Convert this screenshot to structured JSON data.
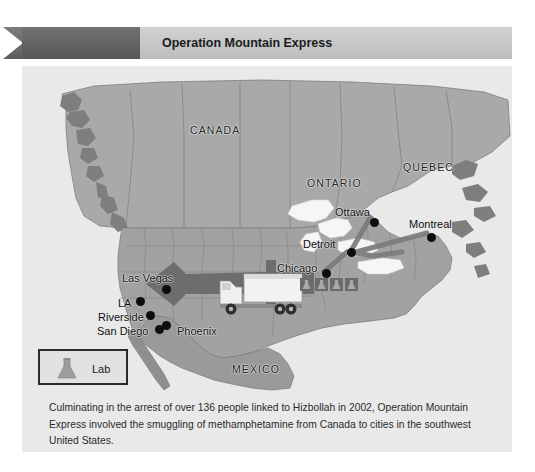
{
  "figure": {
    "number": "Figure 20-1",
    "title": "Operation Mountain Express",
    "caption": "Culminating in the arrest of over 136 people linked to Hizbollah in 2002, Operation Mountain Express involved the smuggling of methamphetamine from Canada to cities in the southwest United States."
  },
  "legend": {
    "label": "Lab",
    "icon": "flask-icon"
  },
  "map": {
    "regions": [
      {
        "name": "CANADA",
        "x": 168,
        "y": 58
      },
      {
        "name": "ONTARIO",
        "x": 285,
        "y": 111
      },
      {
        "name": "QUEBEC",
        "x": 381,
        "y": 95
      },
      {
        "name": "MEXICO",
        "x": 210,
        "y": 297
      }
    ],
    "cities": [
      {
        "name": "Ottawa",
        "label_x": 313,
        "label_y": 140,
        "dot_x": 348,
        "dot_y": 152,
        "align": "right"
      },
      {
        "name": "Montreal",
        "label_x": 387,
        "label_y": 152,
        "dot_x": 405,
        "dot_y": 167,
        "align": "left"
      },
      {
        "name": "Detroit",
        "label_x": 281,
        "label_y": 172,
        "dot_x": 325,
        "dot_y": 185,
        "align": "right"
      },
      {
        "name": "Chicago",
        "label_x": 255,
        "label_y": 196,
        "dot_x": 300,
        "dot_y": 207,
        "align": "right"
      },
      {
        "name": "Las Vegas",
        "label_x": 100,
        "label_y": 206,
        "dot_x": 140,
        "dot_y": 219,
        "align": "right"
      },
      {
        "name": "LA",
        "label_x": 96,
        "label_y": 231,
        "dot_x": 114,
        "dot_y": 241,
        "align": "right"
      },
      {
        "name": "Riverside",
        "label_x": 76,
        "label_y": 245,
        "dot_x": 122,
        "dot_y": 256,
        "align": "right"
      },
      {
        "name": "San Diego",
        "label_x": 75,
        "label_y": 259,
        "dot_x": 125,
        "dot_y": 269,
        "align": "right"
      },
      {
        "name": "Phoenix",
        "label_x": 153,
        "label_y": 259,
        "dot_x": 153,
        "dot_y": 250,
        "align": "left"
      }
    ],
    "lab_markers_count": 4,
    "colors": {
      "land": "#a8a8a8",
      "land_secondary": "#9b9b9b",
      "water": "#e9e9e9",
      "lake": "#f4f4f4",
      "border": "#787878",
      "route_arrow": "#6f6f6f",
      "flow_line": "#8a8a8a",
      "city_dot": "#0d0d0d",
      "header_tab": "#636363",
      "header_bar": "#c6c6c6",
      "panel_bg": "#e9e9e9"
    }
  }
}
